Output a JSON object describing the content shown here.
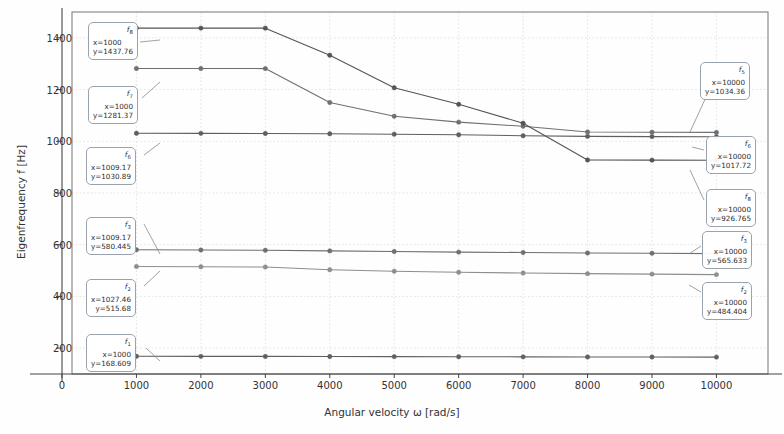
{
  "chart_data": {
    "type": "line",
    "title": "",
    "xlabel": "Angular velocity ω [rad/s]",
    "ylabel": "Eigenfrequency f [Hz]",
    "xlim": [
      0,
      10800
    ],
    "ylim": [
      100,
      1500
    ],
    "xticks": [
      0,
      1000,
      2000,
      3000,
      4000,
      5000,
      6000,
      7000,
      8000,
      9000,
      10000
    ],
    "yticks": [
      200,
      400,
      600,
      800,
      1000,
      1200,
      1400
    ],
    "grid": true,
    "legend": "none",
    "x": [
      1000,
      2000,
      3000,
      4000,
      5000,
      6000,
      7000,
      8000,
      9000,
      10000
    ],
    "series": [
      {
        "name": "f1",
        "values": [
          168.609,
          168.2,
          168.0,
          167.6,
          167.2,
          166.8,
          166.4,
          166.0,
          165.7,
          165.4
        ],
        "color": "#606060"
      },
      {
        "name": "f2",
        "values": [
          515.68,
          514.9,
          513.6,
          503.0,
          497.5,
          493.5,
          490.5,
          488.0,
          486.2,
          484.404
        ],
        "color": "#8e8e8e"
      },
      {
        "name": "f3",
        "values": [
          580.445,
          579.6,
          578.5,
          576.0,
          573.5,
          571.5,
          569.8,
          568.2,
          566.9,
          565.633
        ],
        "color": "#6f6f6f"
      },
      {
        "name": "f6",
        "values": [
          1030.89,
          1030.6,
          1030.2,
          1029.0,
          1027.5,
          1025.0,
          1021.5,
          1019.0,
          1018.2,
          1017.72
        ],
        "color": "#5f5f5f"
      },
      {
        "name": "f7",
        "values": [
          1281.37,
          1281.3,
          1281.2,
          1150.0,
          1097.0,
          1074.0,
          1058.0,
          1036.0,
          1035.0,
          1034.36
        ],
        "color": "#707070"
      },
      {
        "name": "f8",
        "values": [
          1437.76,
          1437.7,
          1437.6,
          1333.0,
          1207.0,
          1143.0,
          1070.0,
          927.5,
          927.0,
          926.765
        ],
        "color": "#555555"
      }
    ],
    "annotations": [
      {
        "id": "a-f8-left",
        "name": "f",
        "sub": "8",
        "x": "x=1000",
        "y": "y=1437.76",
        "align": "left"
      },
      {
        "id": "a-f7-left",
        "name": "f",
        "sub": "7",
        "x": "x=1000",
        "y": "y=1281.37",
        "align": "right"
      },
      {
        "id": "a-f6-left",
        "name": "f",
        "sub": "6",
        "x": "x=1009.17",
        "y": "y=1030.89",
        "align": "right"
      },
      {
        "id": "a-f3-left",
        "name": "f",
        "sub": "3",
        "x": "x=1009.17",
        "y": "y=580.445",
        "align": "right"
      },
      {
        "id": "a-f2-left",
        "name": "f",
        "sub": "2",
        "x": "x=1027.46",
        "y": "y=515.68",
        "align": "right"
      },
      {
        "id": "a-f1-left",
        "name": "f",
        "sub": "1",
        "x": "x=1000",
        "y": "y=168.609",
        "align": "right"
      },
      {
        "id": "a-f5-right",
        "name": "f",
        "sub": "5",
        "x": "x=10000",
        "y": "y=1034.36",
        "align": "right"
      },
      {
        "id": "a-f6-right",
        "name": "f",
        "sub": "6",
        "x": "x=10000",
        "y": "y=1017.72",
        "align": "right"
      },
      {
        "id": "a-f8-right",
        "name": "f",
        "sub": "8",
        "x": "x=10000",
        "y": "y=926.765",
        "align": "right"
      },
      {
        "id": "a-f3-right",
        "name": "f",
        "sub": "3",
        "x": "x=10000",
        "y": "y=565.633",
        "align": "right"
      },
      {
        "id": "a-f2-right",
        "name": "f",
        "sub": "2",
        "x": "x=10000",
        "y": "y=484.404",
        "align": "right"
      }
    ]
  },
  "axes": {
    "xticklabels": [
      "0",
      "1000",
      "2000",
      "3000",
      "4000",
      "5000",
      "6000",
      "7000",
      "8000",
      "9000",
      "10000"
    ],
    "yticklabels": [
      "200",
      "400",
      "600",
      "800",
      "1000",
      "1200",
      "1400"
    ],
    "xlabel": "Angular velocity ω [rad/s]",
    "ylabel": "Eigenfrequency f [Hz]"
  }
}
